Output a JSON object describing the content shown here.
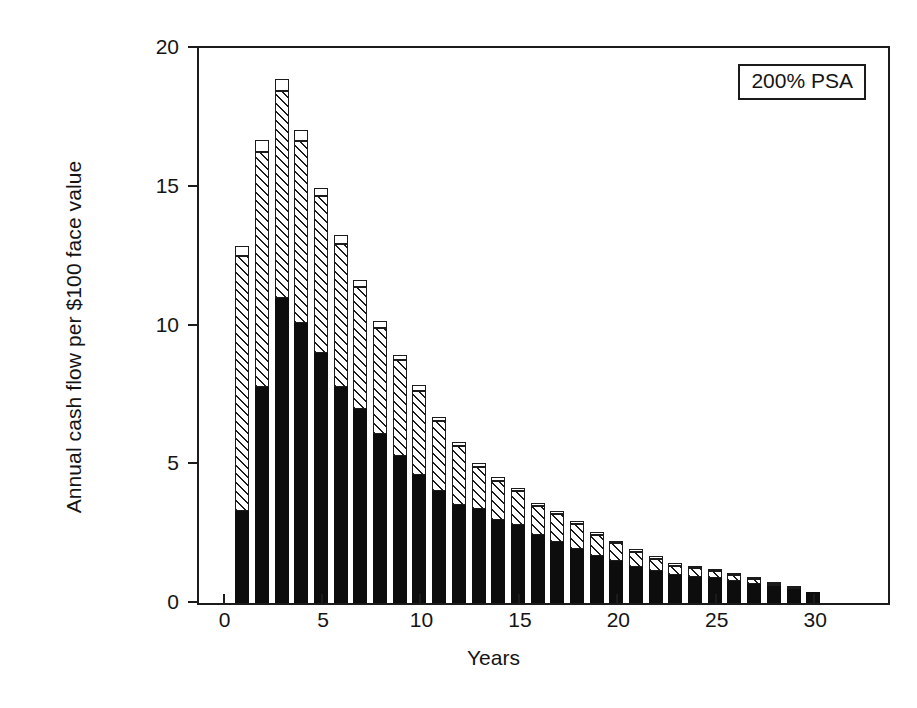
{
  "figure": {
    "background": "#ffffff",
    "frame_color": "#1b1b1b"
  },
  "annotation": {
    "label": "200% PSA"
  },
  "axes": {
    "xlabel": "Years",
    "ylabel": "Annual cash flow per $100 face value",
    "ytick_labels": [
      "0",
      "5",
      "10",
      "15",
      "20"
    ],
    "xtick_labels": [
      "0",
      "5",
      "10",
      "15",
      "20",
      "25",
      "30"
    ]
  },
  "chart_data": {
    "type": "bar",
    "stacked": true,
    "title": "",
    "subtitle": "",
    "xlabel": "Years",
    "ylabel": "Annual cash flow per $100 face value",
    "annotations": [
      "200% PSA"
    ],
    "xlim": [
      -1.2,
      33.8
    ],
    "ylim": [
      0,
      20
    ],
    "yticks": [
      0,
      5,
      10,
      15,
      20
    ],
    "xticks": [
      0,
      5,
      10,
      15,
      20,
      25,
      30
    ],
    "grid": false,
    "legend": null,
    "x": [
      1,
      2,
      3,
      4,
      5,
      6,
      7,
      8,
      9,
      10,
      11,
      12,
      13,
      14,
      15,
      16,
      17,
      18,
      19,
      20,
      21,
      22,
      23,
      24,
      25,
      26,
      27,
      28,
      29,
      30
    ],
    "categories": [
      "1",
      "2",
      "3",
      "4",
      "5",
      "6",
      "7",
      "8",
      "9",
      "10",
      "11",
      "12",
      "13",
      "14",
      "15",
      "16",
      "17",
      "18",
      "19",
      "20",
      "21",
      "22",
      "23",
      "24",
      "25",
      "26",
      "27",
      "28",
      "29",
      "30"
    ],
    "series": [
      {
        "name": "prepayments",
        "fill": "solid-black",
        "color": "#0d0d0d",
        "values": [
          3.3,
          7.8,
          11.0,
          10.1,
          9.0,
          7.8,
          7.0,
          6.1,
          5.3,
          4.6,
          4.05,
          3.55,
          3.4,
          3.0,
          2.8,
          2.45,
          2.2,
          1.95,
          1.7,
          1.5,
          1.3,
          1.15,
          1.0,
          0.95,
          0.9,
          0.8,
          0.7,
          0.6,
          0.5,
          0.4
        ]
      },
      {
        "name": "scheduled-principal-and-interest",
        "fill": "diagonal-hatch",
        "color": "#1b1b1b",
        "values": [
          9.2,
          8.45,
          7.45,
          6.55,
          5.65,
          5.15,
          4.4,
          3.8,
          3.45,
          3.05,
          2.5,
          2.1,
          1.5,
          1.4,
          1.25,
          1.05,
          1.0,
          0.9,
          0.75,
          0.65,
          0.55,
          0.45,
          0.35,
          0.3,
          0.25,
          0.2,
          0.15,
          0.1,
          0.05,
          0.0
        ]
      },
      {
        "name": "residual",
        "fill": "open-white",
        "color": "#ffffff",
        "values": [
          0.35,
          0.45,
          0.45,
          0.4,
          0.3,
          0.3,
          0.25,
          0.25,
          0.2,
          0.2,
          0.15,
          0.15,
          0.15,
          0.15,
          0.1,
          0.1,
          0.1,
          0.1,
          0.1,
          0.1,
          0.1,
          0.1,
          0.1,
          0.1,
          0.05,
          0.05,
          0.05,
          0.05,
          0.05,
          0.0
        ]
      }
    ],
    "totals": [
      12.85,
      16.7,
      18.9,
      17.05,
      14.95,
      13.25,
      11.65,
      10.15,
      8.95,
      7.85,
      6.7,
      5.8,
      5.05,
      4.55,
      4.15,
      3.6,
      3.3,
      2.95,
      2.55,
      2.25,
      1.95,
      1.7,
      1.45,
      1.35,
      1.2,
      1.05,
      0.9,
      0.75,
      0.6,
      0.4
    ]
  }
}
